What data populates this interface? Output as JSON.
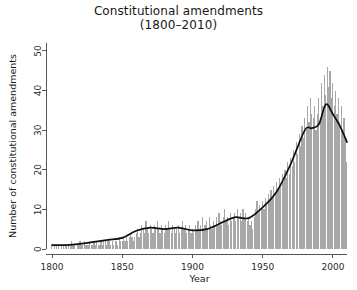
{
  "figure": {
    "title_line1": "Constitutional amendments",
    "title_line2": "(1800–2010)",
    "background_color": "#ffffff"
  },
  "chart_data": {
    "type": "bar",
    "title": "Constitutional amendments (1800–2010)",
    "subtitle": "(1800–2010)",
    "xlabel": "Year",
    "ylabel": "Number of constitutional amendments",
    "xlim": [
      1800,
      2010
    ],
    "ylim": [
      0,
      52
    ],
    "grid": false,
    "legend": null,
    "bar_color": "#a8a8a8",
    "line_color": "#101010",
    "xticks": [
      1800,
      1850,
      1900,
      1950,
      2000
    ],
    "xtick_labels": [
      "1800",
      "1850",
      "1900",
      "1950",
      "2000"
    ],
    "yticks": [
      0,
      10,
      20,
      30,
      40,
      50
    ],
    "ytick_labels": [
      "0",
      "10",
      "20",
      "30",
      "40",
      "50"
    ],
    "x": [
      1800,
      1801,
      1802,
      1803,
      1804,
      1805,
      1806,
      1807,
      1808,
      1809,
      1810,
      1811,
      1812,
      1813,
      1814,
      1815,
      1816,
      1817,
      1818,
      1819,
      1820,
      1821,
      1822,
      1823,
      1824,
      1825,
      1826,
      1827,
      1828,
      1829,
      1830,
      1831,
      1832,
      1833,
      1834,
      1835,
      1836,
      1837,
      1838,
      1839,
      1840,
      1841,
      1842,
      1843,
      1844,
      1845,
      1846,
      1847,
      1848,
      1849,
      1850,
      1851,
      1852,
      1853,
      1854,
      1855,
      1856,
      1857,
      1858,
      1859,
      1860,
      1861,
      1862,
      1863,
      1864,
      1865,
      1866,
      1867,
      1868,
      1869,
      1870,
      1871,
      1872,
      1873,
      1874,
      1875,
      1876,
      1877,
      1878,
      1879,
      1880,
      1881,
      1882,
      1883,
      1884,
      1885,
      1886,
      1887,
      1888,
      1889,
      1890,
      1891,
      1892,
      1893,
      1894,
      1895,
      1896,
      1897,
      1898,
      1899,
      1900,
      1901,
      1902,
      1903,
      1904,
      1905,
      1906,
      1907,
      1908,
      1909,
      1910,
      1911,
      1912,
      1913,
      1914,
      1915,
      1916,
      1917,
      1918,
      1919,
      1920,
      1921,
      1922,
      1923,
      1924,
      1925,
      1926,
      1927,
      1928,
      1929,
      1930,
      1931,
      1932,
      1933,
      1934,
      1935,
      1936,
      1937,
      1938,
      1939,
      1940,
      1941,
      1942,
      1943,
      1944,
      1945,
      1946,
      1947,
      1948,
      1949,
      1950,
      1951,
      1952,
      1953,
      1954,
      1955,
      1956,
      1957,
      1958,
      1959,
      1960,
      1961,
      1962,
      1963,
      1964,
      1965,
      1966,
      1967,
      1968,
      1969,
      1970,
      1971,
      1972,
      1973,
      1974,
      1975,
      1976,
      1977,
      1978,
      1979,
      1980,
      1981,
      1982,
      1983,
      1984,
      1985,
      1986,
      1987,
      1988,
      1989,
      1990,
      1991,
      1992,
      1993,
      1994,
      1995,
      1996,
      1997,
      1998,
      1999,
      2000,
      2001,
      2002,
      2003,
      2004,
      2005,
      2006,
      2007,
      2008,
      2009,
      2010
    ],
    "values": [
      1,
      0,
      1,
      1,
      0,
      1,
      0,
      1,
      1,
      0,
      1,
      0,
      1,
      1,
      2,
      1,
      1,
      0,
      1,
      1,
      2,
      1,
      1,
      2,
      1,
      1,
      1,
      2,
      1,
      1,
      2,
      1,
      2,
      1,
      1,
      2,
      1,
      2,
      2,
      1,
      2,
      2,
      1,
      2,
      1,
      2,
      2,
      1,
      3,
      2,
      2,
      3,
      2,
      3,
      2,
      3,
      4,
      3,
      2,
      3,
      4,
      5,
      3,
      4,
      6,
      5,
      4,
      7,
      5,
      4,
      6,
      5,
      4,
      6,
      5,
      7,
      5,
      4,
      6,
      5,
      4,
      6,
      5,
      7,
      5,
      4,
      6,
      5,
      4,
      5,
      6,
      4,
      5,
      7,
      5,
      6,
      4,
      5,
      6,
      4,
      5,
      4,
      6,
      5,
      7,
      5,
      6,
      8,
      5,
      6,
      7,
      5,
      8,
      6,
      5,
      7,
      6,
      8,
      6,
      9,
      7,
      6,
      8,
      10,
      7,
      8,
      6,
      9,
      7,
      8,
      9,
      7,
      10,
      8,
      9,
      7,
      10,
      8,
      9,
      7,
      8,
      6,
      7,
      5,
      8,
      10,
      12,
      9,
      11,
      10,
      12,
      10,
      13,
      11,
      14,
      12,
      15,
      13,
      16,
      14,
      17,
      15,
      18,
      16,
      19,
      17,
      20,
      18,
      22,
      19,
      23,
      21,
      25,
      22,
      27,
      24,
      29,
      26,
      31,
      28,
      33,
      30,
      36,
      32,
      38,
      34,
      33,
      36,
      30,
      34,
      38,
      33,
      42,
      36,
      44,
      39,
      46,
      41,
      45,
      38,
      42,
      36,
      40,
      34,
      38,
      32,
      36,
      30,
      33,
      28,
      22
    ],
    "smooth_series": {
      "name": "LOESS smooth",
      "x": [
        1800,
        1810,
        1820,
        1830,
        1840,
        1850,
        1860,
        1870,
        1880,
        1890,
        1900,
        1910,
        1920,
        1930,
        1940,
        1950,
        1960,
        1970,
        1980,
        1985,
        1990,
        1995,
        2000,
        2005,
        2010
      ],
      "values": [
        1.0,
        1.0,
        1.3,
        1.8,
        2.3,
        2.8,
        4.6,
        5.4,
        5.0,
        5.4,
        4.7,
        5.0,
        6.5,
        8.0,
        7.8,
        10.5,
        14.5,
        21.5,
        30.0,
        30.5,
        31.5,
        36.5,
        34.0,
        31.0,
        27.0
      ]
    }
  },
  "axis": {
    "x_title": "Year",
    "y_title": "Number of constitutional amendments"
  }
}
